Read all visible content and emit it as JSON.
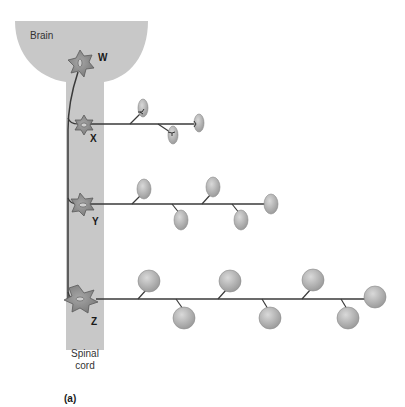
{
  "figure": {
    "panel_label": "(a)",
    "colors": {
      "cns_fill": "#c8c8c8",
      "neuron_fill": "#8c8c8c",
      "neuron_stroke": "#5a5a5a",
      "axon": "#3a3a3a",
      "muscle_fill": "#b5b5b5",
      "muscle_stroke": "#8a8a8a",
      "background": "#ffffff"
    },
    "regions": {
      "brain": "Brain",
      "spinal_cord_line1": "Spinal",
      "spinal_cord_line2": "cord"
    },
    "neurons": [
      {
        "label": "W",
        "type": "upper motor neuron",
        "x": 80,
        "y": 63
      },
      {
        "label": "X",
        "type": "motor neuron",
        "x": 84,
        "y": 124,
        "muscle_fibers": 3
      },
      {
        "label": "Y",
        "type": "motor neuron",
        "x": 84,
        "y": 204,
        "muscle_fibers": 5
      },
      {
        "label": "Z",
        "type": "motor neuron",
        "x": 80,
        "y": 299,
        "muscle_fibers": 7
      }
    ]
  }
}
